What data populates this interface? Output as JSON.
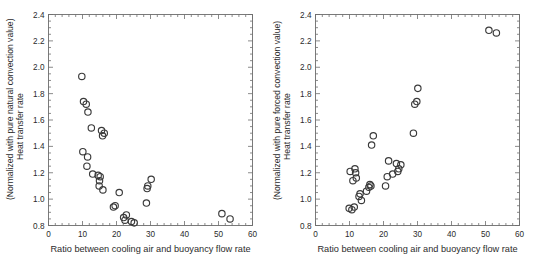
{
  "figure": {
    "panel_count": 2,
    "background_color": "#ffffff",
    "marker_color": "#3a3a3a",
    "axis_color": "#6d6d6d"
  },
  "chart_data": [
    {
      "type": "scatter",
      "panel": "left",
      "title": "",
      "xlabel": "Ratio between cooling air and buoyancy flow rate",
      "ylabel_line1": "(Normalized with pure natural convection value)",
      "ylabel_line2": "Heat transfer rate",
      "xlim": [
        0,
        60
      ],
      "ylim": [
        0.8,
        2.4
      ],
      "xticks": [
        0,
        10,
        20,
        30,
        40,
        50,
        60
      ],
      "xtick_labels": [
        "0",
        "10",
        "20",
        "30",
        "40",
        "50",
        "60"
      ],
      "yticks": [
        0.8,
        1.0,
        1.2,
        1.4,
        1.6,
        1.8,
        2.0,
        2.2,
        2.4
      ],
      "ytick_labels": [
        "0.8",
        "1.0",
        "1.2",
        "1.4",
        "1.6",
        "1.8",
        "2.0",
        "2.2",
        "2.4"
      ],
      "xminor_step": 2,
      "yminor_step": 0.05,
      "grid": false,
      "legend": null,
      "marker": "open-circle",
      "points": [
        {
          "x": 9.8,
          "y": 1.93
        },
        {
          "x": 10.3,
          "y": 1.74
        },
        {
          "x": 11.1,
          "y": 1.72
        },
        {
          "x": 11.6,
          "y": 1.66
        },
        {
          "x": 12.6,
          "y": 1.54
        },
        {
          "x": 15.6,
          "y": 1.52
        },
        {
          "x": 16.4,
          "y": 1.5
        },
        {
          "x": 15.9,
          "y": 1.48
        },
        {
          "x": 10.1,
          "y": 1.36
        },
        {
          "x": 11.5,
          "y": 1.32
        },
        {
          "x": 11.3,
          "y": 1.25
        },
        {
          "x": 13.0,
          "y": 1.19
        },
        {
          "x": 14.6,
          "y": 1.18
        },
        {
          "x": 15.2,
          "y": 1.17
        },
        {
          "x": 15.0,
          "y": 1.14
        },
        {
          "x": 14.9,
          "y": 1.1
        },
        {
          "x": 16.0,
          "y": 1.07
        },
        {
          "x": 20.8,
          "y": 1.05
        },
        {
          "x": 19.6,
          "y": 0.95
        },
        {
          "x": 19.1,
          "y": 0.94
        },
        {
          "x": 22.9,
          "y": 0.88
        },
        {
          "x": 22.1,
          "y": 0.86
        },
        {
          "x": 22.5,
          "y": 0.84
        },
        {
          "x": 24.4,
          "y": 0.83
        },
        {
          "x": 25.2,
          "y": 0.82
        },
        {
          "x": 28.8,
          "y": 0.97
        },
        {
          "x": 29.2,
          "y": 1.1
        },
        {
          "x": 29.0,
          "y": 1.08
        },
        {
          "x": 30.2,
          "y": 1.15
        },
        {
          "x": 51.0,
          "y": 0.89
        },
        {
          "x": 53.4,
          "y": 0.85
        }
      ]
    },
    {
      "type": "scatter",
      "panel": "right",
      "title": "",
      "xlabel": "Ratio between cooling air and buoyancy flow rate",
      "ylabel_line1": "(Normalized with pure forced convection value)",
      "ylabel_line2": "Heat transfer rate",
      "xlim": [
        0,
        60
      ],
      "ylim": [
        0.8,
        2.4
      ],
      "xticks": [
        0,
        10,
        20,
        30,
        40,
        50,
        60
      ],
      "xtick_labels": [
        "0",
        "10",
        "20",
        "30",
        "40",
        "50",
        "60"
      ],
      "yticks": [
        0.8,
        1.0,
        1.2,
        1.4,
        1.6,
        1.8,
        2.0,
        2.2,
        2.4
      ],
      "ytick_labels": [
        "0.8",
        "1.0",
        "1.2",
        "1.4",
        "1.6",
        "1.8",
        "2.0",
        "2.2",
        "2.4"
      ],
      "xminor_step": 2,
      "yminor_step": 0.05,
      "grid": false,
      "legend": null,
      "marker": "open-circle",
      "points": [
        {
          "x": 9.9,
          "y": 0.93
        },
        {
          "x": 10.7,
          "y": 0.92
        },
        {
          "x": 11.4,
          "y": 0.94
        },
        {
          "x": 12.8,
          "y": 1.02
        },
        {
          "x": 13.1,
          "y": 1.04
        },
        {
          "x": 13.5,
          "y": 0.99
        },
        {
          "x": 15.0,
          "y": 1.06
        },
        {
          "x": 15.7,
          "y": 1.09
        },
        {
          "x": 16.3,
          "y": 1.1
        },
        {
          "x": 16.0,
          "y": 1.11
        },
        {
          "x": 10.2,
          "y": 1.21
        },
        {
          "x": 11.0,
          "y": 1.14
        },
        {
          "x": 11.6,
          "y": 1.23
        },
        {
          "x": 11.8,
          "y": 1.2
        },
        {
          "x": 12.0,
          "y": 1.16
        },
        {
          "x": 16.5,
          "y": 1.41
        },
        {
          "x": 17.0,
          "y": 1.48
        },
        {
          "x": 20.6,
          "y": 1.1
        },
        {
          "x": 21.1,
          "y": 1.17
        },
        {
          "x": 21.5,
          "y": 1.29
        },
        {
          "x": 22.7,
          "y": 1.19
        },
        {
          "x": 23.8,
          "y": 1.27
        },
        {
          "x": 24.2,
          "y": 1.21
        },
        {
          "x": 24.5,
          "y": 1.23
        },
        {
          "x": 25.1,
          "y": 1.26
        },
        {
          "x": 28.8,
          "y": 1.5
        },
        {
          "x": 29.2,
          "y": 1.72
        },
        {
          "x": 29.8,
          "y": 1.74
        },
        {
          "x": 30.1,
          "y": 1.84
        },
        {
          "x": 51.0,
          "y": 2.28
        },
        {
          "x": 53.2,
          "y": 2.26
        }
      ]
    }
  ]
}
